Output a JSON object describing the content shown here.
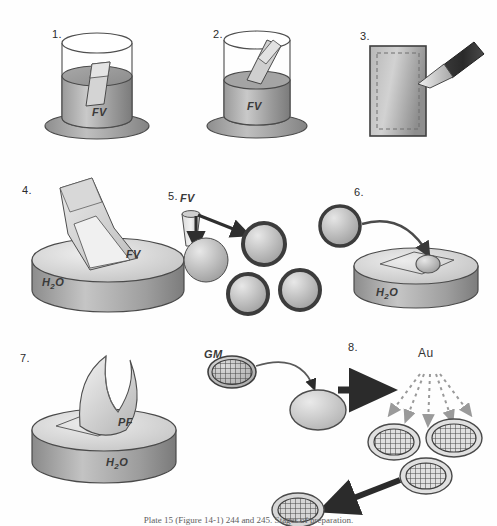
{
  "figure": {
    "caption": "Plate 15 (Figure 14-1) 244 and 245. Stages of preparation.",
    "background_color": "#fefefe",
    "ink_color": "#333333",
    "panel_count": 8
  },
  "panels": [
    {
      "id": "panel-1",
      "number": "1.",
      "description": "Glass slide immersed in a beaker of formvar solution",
      "labels": [
        {
          "name": "solution-label",
          "text": "FV"
        }
      ]
    },
    {
      "id": "panel-2",
      "number": "2.",
      "description": "Coated slide being withdrawn from the formvar beaker",
      "labels": [
        {
          "name": "solution-label",
          "text": "FV"
        }
      ]
    },
    {
      "id": "panel-3",
      "number": "3.",
      "description": "Scoring the edges of the coated slide with a scalpel blade",
      "labels": []
    },
    {
      "id": "panel-4",
      "number": "4.",
      "description": "Floating the formvar film off the slide onto a water surface",
      "labels": [
        {
          "name": "film-label",
          "text": "FV"
        },
        {
          "name": "water-label",
          "text": "H2O"
        }
      ]
    },
    {
      "id": "panel-5",
      "number": "5.",
      "description": "Formvar coating applied to grids / discs",
      "labels": [
        {
          "name": "solution-label",
          "text": "FV"
        }
      ]
    },
    {
      "id": "panel-6",
      "number": "6.",
      "description": "Placing a grid onto the floating film on the water surface",
      "labels": [
        {
          "name": "water-label",
          "text": "H2O"
        }
      ]
    },
    {
      "id": "panel-7",
      "number": "7.",
      "description": "Lifting the parlodion film with grids from the water surface",
      "labels": [
        {
          "name": "film-label",
          "text": "PF"
        },
        {
          "name": "water-label",
          "text": "H2O"
        }
      ]
    },
    {
      "id": "panel-8",
      "number": "8.",
      "description": "Grid mesh transferred then gold shadowed in a vacuum evaporator",
      "labels": [
        {
          "name": "grid-mesh-label",
          "text": "GM"
        },
        {
          "name": "gold-label",
          "text": "Au"
        }
      ]
    }
  ],
  "legend": {
    "FV": "formvar",
    "PF": "parlodion film",
    "GM": "grid mesh",
    "Au": "gold",
    "H2O": "water"
  }
}
